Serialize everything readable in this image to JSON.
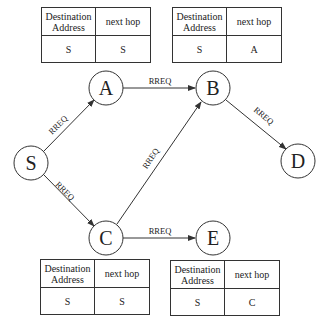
{
  "diagram": {
    "type": "network-route-request-flooding",
    "nodes": [
      {
        "id": "S",
        "label": "S",
        "cx": 31,
        "cy": 163
      },
      {
        "id": "A",
        "label": "A",
        "cx": 106,
        "cy": 88
      },
      {
        "id": "B",
        "label": "B",
        "cx": 213,
        "cy": 88
      },
      {
        "id": "C",
        "label": "C",
        "cx": 106,
        "cy": 238
      },
      {
        "id": "D",
        "label": "D",
        "cx": 298,
        "cy": 161
      },
      {
        "id": "E",
        "label": "E",
        "cx": 213,
        "cy": 238
      }
    ],
    "edges": [
      {
        "from": "S",
        "to": "A",
        "label": "RREQ"
      },
      {
        "from": "S",
        "to": "C",
        "label": "RREQ"
      },
      {
        "from": "A",
        "to": "B",
        "label": "RREQ"
      },
      {
        "from": "C",
        "to": "B",
        "label": "RREQ"
      },
      {
        "from": "C",
        "to": "E",
        "label": "RREQ"
      },
      {
        "from": "B",
        "to": "D",
        "label": "RREQ"
      }
    ]
  },
  "tables": {
    "node_A": {
      "header": {
        "dest": "Destination Address",
        "hop": "next hop"
      },
      "row": {
        "dest": "S",
        "hop": "S"
      }
    },
    "node_B": {
      "header": {
        "dest": "Destination Address",
        "hop": "next hop"
      },
      "row": {
        "dest": "S",
        "hop": "A"
      }
    },
    "node_C": {
      "header": {
        "dest": "Destination Address",
        "hop": "next hop"
      },
      "row": {
        "dest": "S",
        "hop": "S"
      }
    },
    "node_E": {
      "header": {
        "dest": "Destination Address",
        "hop": "next hop"
      },
      "row": {
        "dest": "S",
        "hop": "C"
      }
    }
  },
  "colors": {
    "stroke": "#333333",
    "text": "#222222",
    "background": "#ffffff"
  }
}
